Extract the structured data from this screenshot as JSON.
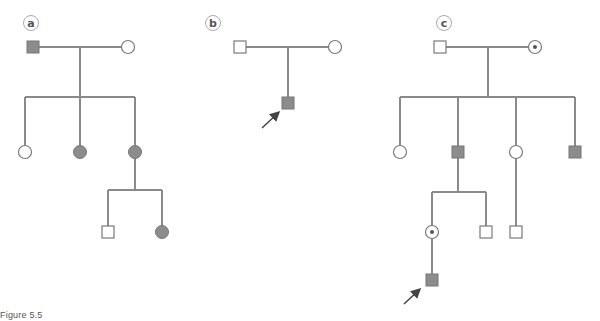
{
  "figure": {
    "caption": "Figure 5.5",
    "colors": {
      "line": "#8a8a8a",
      "affected_fill": "#8c8c8c",
      "unaffected_fill": "#ffffff",
      "stroke": "#7a7a7a",
      "arrow": "#444444",
      "carrier_dot": "#555555"
    },
    "legend_symbols": {
      "square": "male",
      "circle": "female",
      "filled": "affected",
      "dot-in-circle": "carrier female",
      "arrow": "proband"
    }
  },
  "pedigrees": [
    {
      "label": "a",
      "generations": [
        [
          "male affected",
          "female unaffected"
        ],
        [
          "female unaffected",
          "female affected",
          "female affected"
        ],
        [
          "male unaffected",
          "female affected"
        ]
      ]
    },
    {
      "label": "b",
      "generations": [
        [
          "male unaffected",
          "female unaffected"
        ],
        [
          "male affected (proband)"
        ]
      ]
    },
    {
      "label": "c",
      "generations": [
        [
          "male unaffected",
          "female carrier"
        ],
        [
          "female unaffected",
          "male affected",
          "female unaffected",
          "male affected"
        ],
        [
          "female carrier",
          "male unaffected",
          "male unaffected"
        ],
        [
          "male affected (proband)"
        ]
      ]
    }
  ]
}
